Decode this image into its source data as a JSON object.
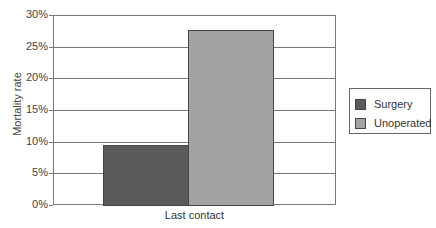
{
  "chart_data": {
    "type": "bar",
    "title": "",
    "xlabel": "",
    "ylabel": "Mortality rate",
    "categories": [
      "Last contact"
    ],
    "series": [
      {
        "name": "Surgery",
        "values": [
          9.5
        ],
        "color": "#5a5a5a"
      },
      {
        "name": "Unoperated",
        "values": [
          27.7
        ],
        "color": "#a3a3a3"
      }
    ],
    "ylim": [
      0,
      30
    ],
    "yticks": [
      "0%",
      "5%",
      "10%",
      "15%",
      "20%",
      "25%",
      "30%"
    ],
    "grid": true,
    "legend_position": "right"
  }
}
